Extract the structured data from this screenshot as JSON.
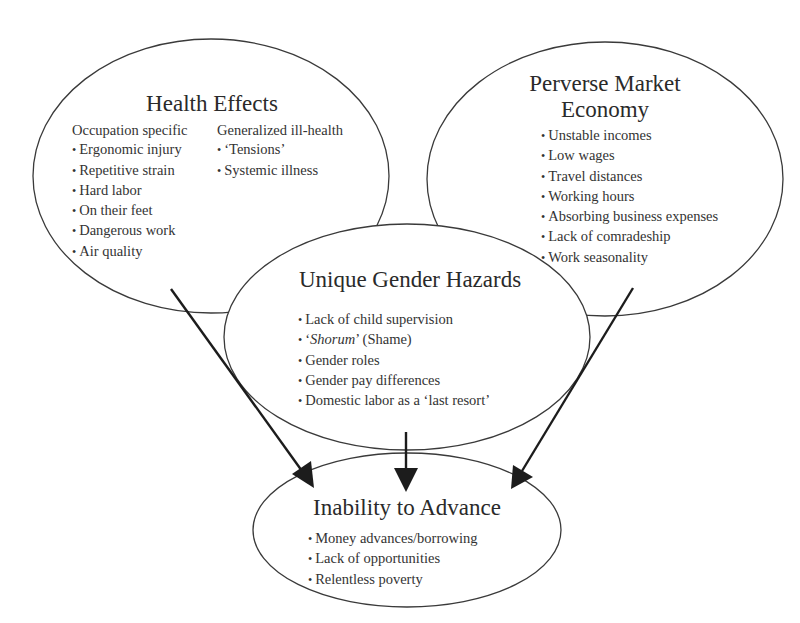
{
  "diagram": {
    "nodes": {
      "health_effects": {
        "title": "Health Effects",
        "groups": [
          {
            "heading": "Occupation specific",
            "items": [
              "Ergonomic injury",
              "Repetitive strain",
              "Hard labor",
              "On their feet",
              "Dangerous work",
              "Air quality"
            ]
          },
          {
            "heading": "Generalized ill-health",
            "items": [
              "‘Tensions’",
              "Systemic illness"
            ]
          }
        ]
      },
      "perverse_market_economy": {
        "title_line1": "Perverse Market",
        "title_line2": "Economy",
        "items": [
          "Unstable incomes",
          "Low wages",
          "Travel distances",
          "Working hours",
          "Absorbing business expenses",
          "Lack of comradeship",
          "Work seasonality"
        ]
      },
      "unique_gender_hazards": {
        "title": "Unique Gender Hazards",
        "items": [
          {
            "text": "Lack of child supervision"
          },
          {
            "prefix": "‘",
            "italic": "Shorum",
            "suffix": "’ (Shame)"
          },
          {
            "text": "Gender roles"
          },
          {
            "text": "Gender pay differences"
          },
          {
            "text": "Domestic labor as a ‘last resort’"
          }
        ]
      },
      "inability_to_advance": {
        "title": "Inability to Advance",
        "items": [
          "Money advances/borrowing",
          "Lack of opportunities",
          "Relentless poverty"
        ]
      }
    },
    "edges": [
      {
        "from": "Health Effects",
        "to": "Inability to Advance"
      },
      {
        "from": "Unique Gender Hazards",
        "to": "Inability to Advance"
      },
      {
        "from": "Perverse Market Economy",
        "to": "Inability to Advance"
      }
    ],
    "colors": {
      "outline": "#3a3a3a",
      "arrow": "#1c1c1c",
      "text": "#2b2b2b",
      "background": "#ffffff"
    }
  }
}
